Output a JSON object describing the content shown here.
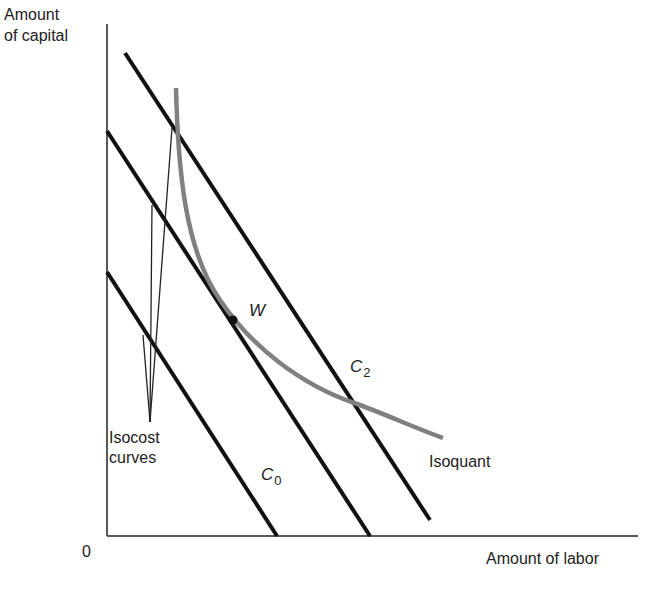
{
  "diagram": {
    "y_axis_label_line1": "Amount",
    "y_axis_label_line2": "of capital",
    "x_axis_label": "Amount of labor",
    "origin_label": "0",
    "isocost_label_line1": "Isocost",
    "isocost_label_line2": "curves",
    "isoquant_label": "Isoquant",
    "point_label": "W",
    "c0_label": "C",
    "c0_sub": "0",
    "c2_label": "C",
    "c2_sub": "2",
    "colors": {
      "lines": "#111111",
      "isoquant": "#808080",
      "axes": "#222222"
    }
  }
}
